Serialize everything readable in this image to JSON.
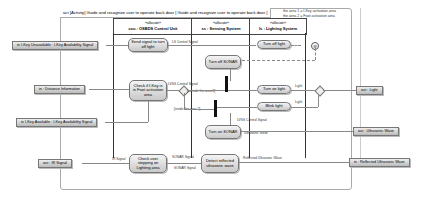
{
  "frame": {
    "title": "act [Activity] Guide and recognize user to operate back door [ Guide and recognize user to operate back door ]",
    "comment": [
      "the area 1 = I-Key activation area",
      "the area 2 = Foot activation area"
    ]
  },
  "lanes": [
    {
      "stereotype": "«allocate»",
      "name": "ccu : OSBDS Control Unit"
    },
    {
      "stereotype": "«allocate»",
      "name": "ss : Sensing System"
    },
    {
      "stereotype": "«allocate»",
      "name": "ls : Lighting System"
    }
  ],
  "actions": {
    "send_signal": "Send signal to turn off light",
    "turn_off_sonar": "Turn off SONAR",
    "check_ikey": "Check if I-Key is in Foot activation area",
    "turn_off_light": "Turn off light",
    "turn_on_light": "Turn on light",
    "blink_light": "Blink light",
    "turn_on_sonar": "Turn on SONAR",
    "check_user": "Check user stepping on Lighting area",
    "detect_wave": "Detect reflected ultrasonic wave"
  },
  "pins": {
    "in_ikey_unavailable": "in I-Key Unavailable : I-Key Availability Signal",
    "in_distance": "in : Distance Information",
    "in_ikey_available": "in I-Key Available : I-Key Availability Signal",
    "out_ir": "out : IR Signal",
    "out_light": "out : Light",
    "out_ultrasonic": "out : Ultrasonic Wave",
    "in_reflected": "in : Reflected Ultrasonic Wave"
  },
  "labels": {
    "ls_control_1": "LS Control Signal",
    "lvss_control_1": "LVSS Control Signal",
    "outside_area2": "[outside the area 2]",
    "inside_area2": "[inside the area 2]",
    "lvss_control_2": "LVSS Control Signal",
    "ultrasonic_wave": "Ultrasonic Wave",
    "light_1": "Light",
    "light_2": "Light",
    "ir_signal": "IR Signal",
    "sonar_signal_1": "SONAR Signal",
    "sonar_signal_2": "SONAR Signal",
    "reflected_wave": "Reflected Ultrasonic Wave"
  }
}
